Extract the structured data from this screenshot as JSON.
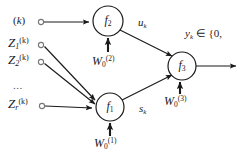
{
  "figure": {
    "type": "neural-network-block-diagram",
    "background_color": "#ffffff",
    "stroke_color": "#1a1a1a"
  },
  "nodes": [
    {
      "id": "f2",
      "label": "f",
      "subscript": "2",
      "cx": 108,
      "cy": 21,
      "r": 15
    },
    {
      "id": "f1",
      "label": "f",
      "subscript": "1",
      "cx": 110,
      "cy": 107,
      "r": 14
    },
    {
      "id": "f3",
      "label": "f",
      "subscript": "3",
      "cx": 182,
      "cy": 66,
      "r": 14
    }
  ],
  "inputs": [
    {
      "id": "k-input",
      "text": "(k)",
      "italic": "k",
      "dot_x": 41,
      "dot_y": 22,
      "label_x": 14,
      "label_y": 16
    },
    {
      "id": "z1-input",
      "base": "Z",
      "sub": "1",
      "sup": "(k)",
      "dot_x": 41,
      "dot_y": 45,
      "label_x": 8,
      "label_y": 37
    },
    {
      "id": "z2-input",
      "base": "Z",
      "sub": "2",
      "sup": "(k)",
      "dot_x": 41,
      "dot_y": 62,
      "label_x": 8,
      "label_y": 54
    },
    {
      "id": "zr-input",
      "base": "Z",
      "sub": "r",
      "sup": "(k)",
      "dot_x": 42,
      "dot_y": 106,
      "label_x": 8,
      "label_y": 98
    }
  ],
  "ellipsis": {
    "text": "...",
    "x": 13,
    "y": 82
  },
  "bias_labels": [
    {
      "id": "w0-2",
      "base": "W",
      "sub": "0",
      "sup": "(2)",
      "x": 94,
      "y": 57,
      "arrow_x": 108,
      "arrow_y_from": 52,
      "arrow_y_to": 37
    },
    {
      "id": "w0-1",
      "base": "W",
      "sub": "0",
      "sup": "(1)",
      "x": 95,
      "y": 139,
      "arrow_x": 110,
      "arrow_y_from": 135,
      "arrow_y_to": 122
    },
    {
      "id": "w0-3",
      "base": "W",
      "sub": "0",
      "sup": "(3)",
      "x": 166,
      "y": 97,
      "arrow_x": 180,
      "arrow_y_from": 93,
      "arrow_y_to": 81
    }
  ],
  "signal_labels": [
    {
      "id": "uk",
      "base": "u",
      "sub": "k",
      "x": 140,
      "y": 19
    },
    {
      "id": "sk",
      "base": "s",
      "sub": "k",
      "x": 140,
      "y": 105
    }
  ],
  "output": {
    "id": "yk-output",
    "base": "y",
    "sub": "k",
    "rest": " ∈ {0,",
    "x": 186,
    "y": 30,
    "arrow_from_x": 196,
    "arrow_to_x": 238,
    "arrow_y": 66
  },
  "edges": [
    {
      "from": "k-input",
      "to": "f2",
      "kind": "horizontal"
    },
    {
      "from": "z1-input",
      "to": "f1",
      "kind": "diagonal"
    },
    {
      "from": "z2-input",
      "to": "f1",
      "kind": "diagonal"
    },
    {
      "from": "zr-input",
      "to": "f1",
      "kind": "horizontal"
    },
    {
      "from": "f2",
      "to": "f3",
      "kind": "diagonal",
      "signal": "uk"
    },
    {
      "from": "f1",
      "to": "f3",
      "kind": "diagonal",
      "signal": "sk"
    },
    {
      "from": "f3",
      "to": "yk-output",
      "kind": "horizontal"
    }
  ]
}
